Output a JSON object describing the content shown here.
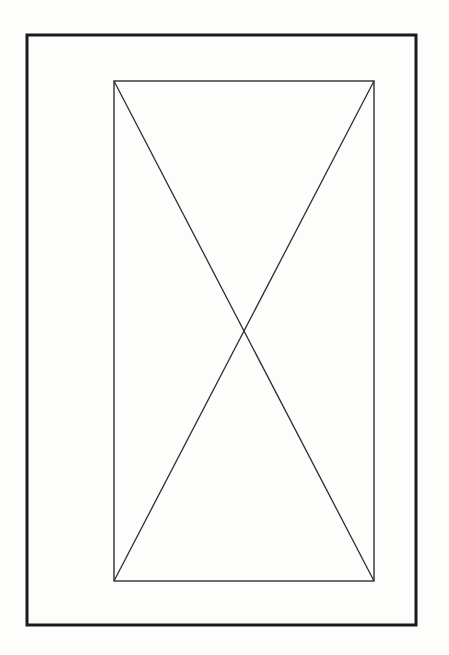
{
  "figure": {
    "background_color": "#fdfdfc",
    "outer_frame": {
      "stroke": "#1b1b1b",
      "stroke_width": "3"
    },
    "inner_box": {
      "stroke": "#2e2e30",
      "stroke_width": "1.4"
    },
    "diagonal_tl_br": {
      "stroke": "#2e2e30",
      "stroke_width": "1.3"
    },
    "diagonal_tr_bl": {
      "stroke": "#2e2e30",
      "stroke_width": "1.3"
    }
  }
}
